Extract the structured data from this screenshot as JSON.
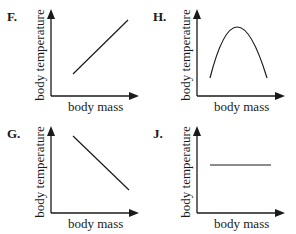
{
  "figure": {
    "panels": [
      {
        "id": "F",
        "label": "F.",
        "ylabel": "body temperature",
        "xlabel": "body mass",
        "relationship": "increasing linear"
      },
      {
        "id": "H",
        "label": "H.",
        "ylabel": "body temperature",
        "xlabel": "body mass",
        "relationship": "inverted parabola"
      },
      {
        "id": "G",
        "label": "G.",
        "ylabel": "body temperature",
        "xlabel": "body mass",
        "relationship": "decreasing linear"
      },
      {
        "id": "J",
        "label": "J.",
        "ylabel": "body temperature",
        "xlabel": "body mass",
        "relationship": "constant"
      }
    ],
    "line_color": "#1a1a1a"
  }
}
